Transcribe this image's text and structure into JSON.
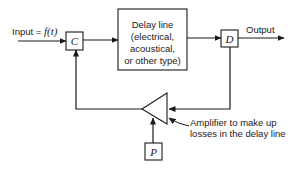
{
  "diagram": {
    "input_label_prefix": "Input = ",
    "input_label_func": "f(t)",
    "box_c": "C",
    "box_d": "D",
    "box_p": "P",
    "delay_line": [
      "Delay line",
      "(electrical,",
      "acoustical,",
      "or other type)"
    ],
    "output_label": "Output",
    "amplifier_note": [
      "Amplifier to make up",
      "losses in the delay line"
    ],
    "stroke_color": "#1a1a1a"
  }
}
